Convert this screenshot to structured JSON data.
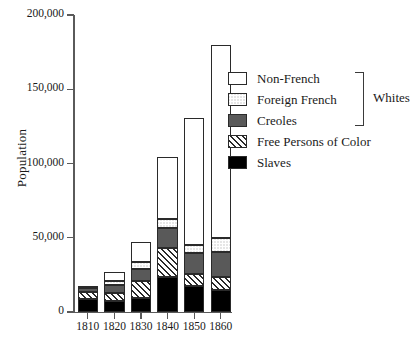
{
  "chart_data": {
    "type": "bar",
    "stacked": true,
    "title": "",
    "xlabel": "",
    "ylabel": "Population",
    "categories": [
      "1810",
      "1820",
      "1830",
      "1840",
      "1850",
      "1860"
    ],
    "ylim": [
      0,
      200000
    ],
    "ytick_values": [
      0,
      50000,
      100000,
      150000,
      200000
    ],
    "ytick_labels": [
      "0",
      "50,000",
      "100,000",
      "150,000",
      "200,000"
    ],
    "grid": false,
    "legend_position": "right-upper",
    "stack_order_bottom_to_top": [
      "Slaves",
      "Free Persons of Color",
      "Creoles",
      "Foreign French",
      "Non-French"
    ],
    "series": [
      {
        "name": "Slaves",
        "values": [
          8500,
          7500,
          9500,
          23500,
          17500,
          15000
        ]
      },
      {
        "name": "Free Persons of Color",
        "values": [
          5000,
          5500,
          11500,
          19500,
          8000,
          8500
        ]
      },
      {
        "name": "Creoles",
        "values": [
          2500,
          5500,
          8000,
          13500,
          14000,
          17000
        ]
      },
      {
        "name": "Foreign French",
        "values": [
          1000,
          2500,
          5000,
          6000,
          5500,
          9000
        ]
      },
      {
        "name": "Non-French",
        "values": [
          500,
          6000,
          13000,
          42000,
          85500,
          130500
        ]
      }
    ],
    "totals": [
      17500,
      27000,
      47000,
      104500,
      130500,
      180000
    ],
    "annotations": [
      {
        "text": "Whites",
        "groups": [
          "Non-French",
          "Foreign French",
          "Creoles"
        ]
      }
    ]
  },
  "legend": {
    "items": [
      {
        "label": "Non-French",
        "swatch": "white-swatch"
      },
      {
        "label": "Foreign French",
        "swatch": "dotted-swatch"
      },
      {
        "label": "Creoles",
        "swatch": "gray-swatch"
      },
      {
        "label": "Free Persons of Color",
        "swatch": "hatched-swatch"
      },
      {
        "label": "Slaves",
        "swatch": "black-swatch"
      }
    ],
    "bracket_label": "Whites"
  },
  "colors": {
    "non_french": "#ffffff",
    "foreign_french": "#ffffff",
    "creoles": "#595959",
    "free_persons_of_color": "#ffffff",
    "slaves": "#000000",
    "outline": "#2a2a2a",
    "axis": "#5a5a5a",
    "text": "#1a1a1a"
  }
}
